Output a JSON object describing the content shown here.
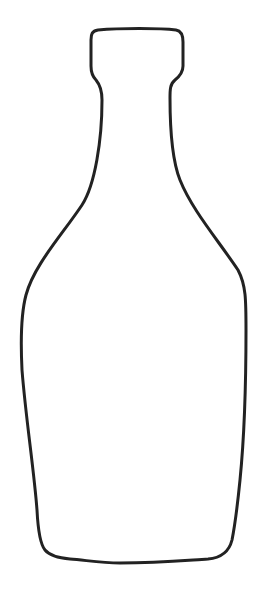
{
  "drawing": {
    "subject": "bottle-outline",
    "stroke_color": "#222222",
    "background_color": "#ffffff",
    "stroke_width": 3
  }
}
